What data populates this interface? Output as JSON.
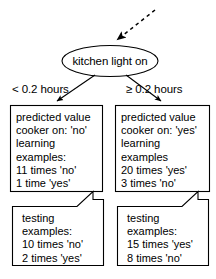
{
  "diagram": {
    "title_node": {
      "label": "kitchen light on",
      "shape": "ellipse"
    },
    "incoming_arrow": {
      "name": "dashed-pointer-arrow",
      "style": "dashed",
      "direction": "down-left"
    },
    "edges": [
      {
        "label": "< 0.2 hours",
        "side": "left"
      },
      {
        "label": "≥ 0.2 hours",
        "side": "right"
      }
    ],
    "branches": [
      {
        "side": "left",
        "prediction_box": {
          "lines": [
            "predicted value",
            "cooker on: 'no'",
            "learning",
            "examples:",
            "11 times 'no'",
            "1 time 'yes'"
          ]
        },
        "testing_box": {
          "lines": [
            "testing",
            "examples:",
            "10 times 'no'",
            "2 times 'yes'"
          ]
        }
      },
      {
        "side": "right",
        "prediction_box": {
          "lines": [
            "predicted value",
            "cooker on: 'yes'",
            "learning",
            "examples",
            "20 times 'yes'",
            "3 times 'no'"
          ]
        },
        "testing_box": {
          "lines": [
            "testing",
            "examples:",
            "15 times 'yes'",
            "8 times 'no'"
          ]
        }
      }
    ],
    "colors": {
      "background": "#ffffff",
      "stroke": "#000000",
      "text": "#000000"
    }
  }
}
